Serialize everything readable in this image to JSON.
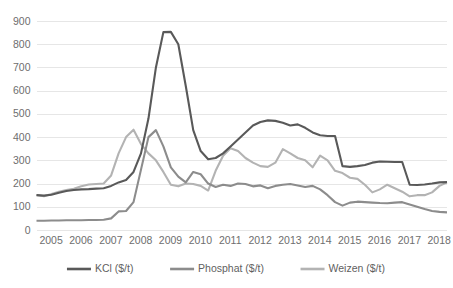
{
  "chart_data": {
    "type": "line",
    "title": "",
    "subtitle": "",
    "xlabel": "",
    "ylabel": "",
    "xlim": [
      2005,
      2018.75
    ],
    "ylim": [
      0,
      900
    ],
    "yticks": [
      0,
      100,
      200,
      300,
      400,
      500,
      600,
      700,
      800,
      900
    ],
    "ytick_labels": [
      "0",
      "100",
      "200",
      "300",
      "400",
      "500",
      "600",
      "700",
      "800",
      "900"
    ],
    "xticks": [
      2005,
      2006,
      2007,
      2008,
      2009,
      2010,
      2011,
      2012,
      2013,
      2014,
      2015,
      2016,
      2017,
      2018
    ],
    "xtick_labels": [
      "2005",
      "2006",
      "2007",
      "2008",
      "2009",
      "2010",
      "2011",
      "2012",
      "2013",
      "2014",
      "2015",
      "2016",
      "2017",
      "2018"
    ],
    "grid": "horizontal",
    "legend_position": "bottom-center",
    "x": [
      2005.0,
      2005.25,
      2005.5,
      2005.75,
      2006.0,
      2006.25,
      2006.5,
      2006.75,
      2007.0,
      2007.25,
      2007.5,
      2007.75,
      2008.0,
      2008.25,
      2008.5,
      2008.75,
      2009.0,
      2009.25,
      2009.5,
      2009.75,
      2010.0,
      2010.25,
      2010.5,
      2010.75,
      2011.0,
      2011.25,
      2011.5,
      2011.75,
      2012.0,
      2012.25,
      2012.5,
      2012.75,
      2013.0,
      2013.25,
      2013.5,
      2013.75,
      2014.0,
      2014.25,
      2014.5,
      2014.75,
      2015.0,
      2015.25,
      2015.5,
      2015.75,
      2016.0,
      2016.25,
      2016.5,
      2016.75,
      2017.0,
      2017.25,
      2017.5,
      2017.75,
      2018.0,
      2018.25,
      2018.5,
      2018.75
    ],
    "series": [
      {
        "name": "KCl ($/t)",
        "color": "#595959",
        "values": [
          150,
          148,
          152,
          160,
          168,
          172,
          175,
          176,
          178,
          180,
          190,
          205,
          215,
          250,
          330,
          480,
          700,
          852,
          853,
          800,
          620,
          430,
          340,
          305,
          310,
          330,
          360,
          390,
          420,
          450,
          465,
          472,
          470,
          462,
          450,
          455,
          440,
          420,
          408,
          405,
          405,
          275,
          272,
          275,
          280,
          290,
          295,
          294,
          293,
          293,
          195,
          194,
          196,
          200,
          205,
          206
        ]
      },
      {
        "name": "Phosphat ($/t)",
        "color": "#8c8c8c",
        "values": [
          40,
          40,
          41,
          41,
          42,
          42,
          42,
          43,
          43,
          44,
          50,
          80,
          82,
          120,
          260,
          400,
          430,
          360,
          270,
          230,
          205,
          250,
          240,
          200,
          185,
          195,
          190,
          200,
          198,
          188,
          192,
          180,
          190,
          195,
          198,
          192,
          185,
          190,
          175,
          150,
          120,
          105,
          118,
          122,
          120,
          118,
          116,
          115,
          118,
          120,
          110,
          100,
          90,
          82,
          78,
          76
        ]
      },
      {
        "name": "Weizen ($/t)",
        "color": "#b3b3b3",
        "values": [
          151,
          145,
          155,
          165,
          172,
          178,
          188,
          196,
          198,
          200,
          235,
          330,
          400,
          432,
          370,
          330,
          300,
          250,
          195,
          188,
          200,
          198,
          190,
          170,
          255,
          320,
          352,
          340,
          310,
          290,
          275,
          272,
          290,
          348,
          330,
          310,
          300,
          270,
          320,
          300,
          255,
          245,
          225,
          220,
          195,
          162,
          175,
          195,
          180,
          165,
          145,
          150,
          150,
          162,
          190,
          205
        ]
      }
    ]
  },
  "legend": {
    "items": [
      {
        "label": "KCl ($/t)",
        "color": "#595959"
      },
      {
        "label": "Phosphat ($/t)",
        "color": "#8c8c8c"
      },
      {
        "label": "Weizen ($/t)",
        "color": "#b3b3b3"
      }
    ]
  },
  "colors": {
    "background": "#ffffff",
    "gridline": "#e6e6e6",
    "tick_text": "#6e6e6e",
    "legend_text": "#5f5f5f"
  }
}
